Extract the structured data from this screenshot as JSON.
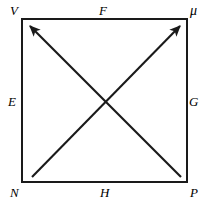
{
  "figure": {
    "type": "square-with-crossed-diagonal-arrows",
    "stroke_color": "#1a1a1a",
    "background_color": "#ffffff",
    "square": {
      "left": 22,
      "top": 19,
      "right": 187,
      "bottom": 182,
      "stroke_width": 2.4
    },
    "center_point": {
      "x": 104.5,
      "y": 100.5
    },
    "vertices": [
      {
        "id": "top-left",
        "label": "V",
        "x": 22,
        "y": 19
      },
      {
        "id": "top-right",
        "label": "μ",
        "x": 187,
        "y": 19
      },
      {
        "id": "bottom-left",
        "label": "N",
        "x": 22,
        "y": 182
      },
      {
        "id": "bottom-right",
        "label": "P",
        "x": 187,
        "y": 182
      }
    ],
    "edge_labels": [
      {
        "id": "top",
        "label": "F",
        "x": 104,
        "y": 19
      },
      {
        "id": "left",
        "label": "E",
        "x": 22,
        "y": 100
      },
      {
        "id": "right",
        "label": "G",
        "x": 187,
        "y": 100
      },
      {
        "id": "bottom",
        "label": "H",
        "x": 104,
        "y": 182
      }
    ],
    "arrows": [
      {
        "id": "diagonal-up-left",
        "from": {
          "x": 181,
          "y": 177
        },
        "to": {
          "x": 30,
          "y": 26
        },
        "arrowhead_at": "to",
        "stroke_width": 2.1
      },
      {
        "id": "diagonal-up-right",
        "from": {
          "x": 32,
          "y": 177
        },
        "to": {
          "x": 180,
          "y": 26
        },
        "arrowhead_at": "to",
        "stroke_width": 2.1
      }
    ]
  }
}
